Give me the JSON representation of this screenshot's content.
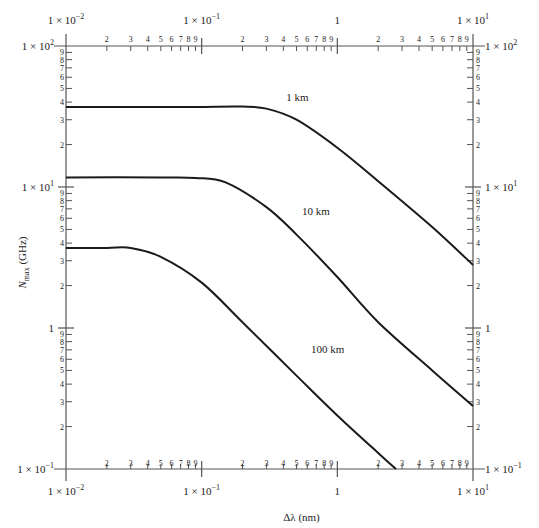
{
  "chart_data": {
    "type": "line",
    "title": "",
    "xlabel": "Δλ (nm)",
    "ylabel": "N_max (GHz)",
    "ylabel_main": "N",
    "ylabel_sub": "max",
    "ylabel_unit": " (GHz)",
    "xscale": "log",
    "yscale": "log",
    "xlim": [
      0.01,
      10
    ],
    "ylim": [
      0.1,
      100
    ],
    "grid": false,
    "x_major_ticks": [
      {
        "value": 0.01,
        "label": "1 × 10⁻²",
        "base": "1 × 10",
        "exp": "−2"
      },
      {
        "value": 0.1,
        "label": "1 × 10⁻¹",
        "base": "1 × 10",
        "exp": "−1"
      },
      {
        "value": 1,
        "label": "1",
        "base": "1",
        "exp": ""
      },
      {
        "value": 10,
        "label": "1 × 10¹",
        "base": "1 × 10",
        "exp": "1"
      }
    ],
    "y_major_ticks": [
      {
        "value": 0.1,
        "label": "1 × 10⁻¹",
        "base": "1 × 10",
        "exp": "−1"
      },
      {
        "value": 1,
        "label": "1",
        "base": "1",
        "exp": ""
      },
      {
        "value": 10,
        "label": "1 × 10¹",
        "base": "1 × 10",
        "exp": "1"
      },
      {
        "value": 100,
        "label": "1 × 10²",
        "base": "1 × 10",
        "exp": "2"
      }
    ],
    "minor_tick_labels": [
      "2",
      "3",
      "4",
      "5",
      "6",
      "7",
      "8",
      "9"
    ],
    "series": [
      {
        "name": "1 km",
        "label_pos": {
          "x": 0.42,
          "y": 41
        },
        "x": [
          0.01,
          0.05,
          0.1,
          0.2,
          0.3,
          0.5,
          1,
          2,
          5,
          10
        ],
        "y": [
          37,
          37,
          37,
          37.2,
          36,
          30,
          19,
          11,
          5.2,
          2.8
        ]
      },
      {
        "name": "10 km",
        "label_pos": {
          "x": 0.55,
          "y": 6.3
        },
        "x": [
          0.01,
          0.05,
          0.09,
          0.15,
          0.3,
          0.5,
          1,
          2,
          5,
          10
        ],
        "y": [
          11.7,
          11.7,
          11.6,
          10.8,
          7.2,
          4.6,
          2.3,
          1.1,
          0.5,
          0.28
        ]
      },
      {
        "name": "100 km",
        "label_pos": {
          "x": 0.64,
          "y": 0.66
        },
        "x": [
          0.01,
          0.02,
          0.03,
          0.05,
          0.1,
          0.2,
          0.5,
          1,
          2,
          2.7
        ],
        "y": [
          3.7,
          3.7,
          3.7,
          3.2,
          2.1,
          1.1,
          0.46,
          0.24,
          0.13,
          0.1
        ]
      }
    ]
  },
  "labels": {
    "series_1": "1 km",
    "series_2": "10 km",
    "series_3": "100 km",
    "xlabel": "Δλ (nm)"
  }
}
